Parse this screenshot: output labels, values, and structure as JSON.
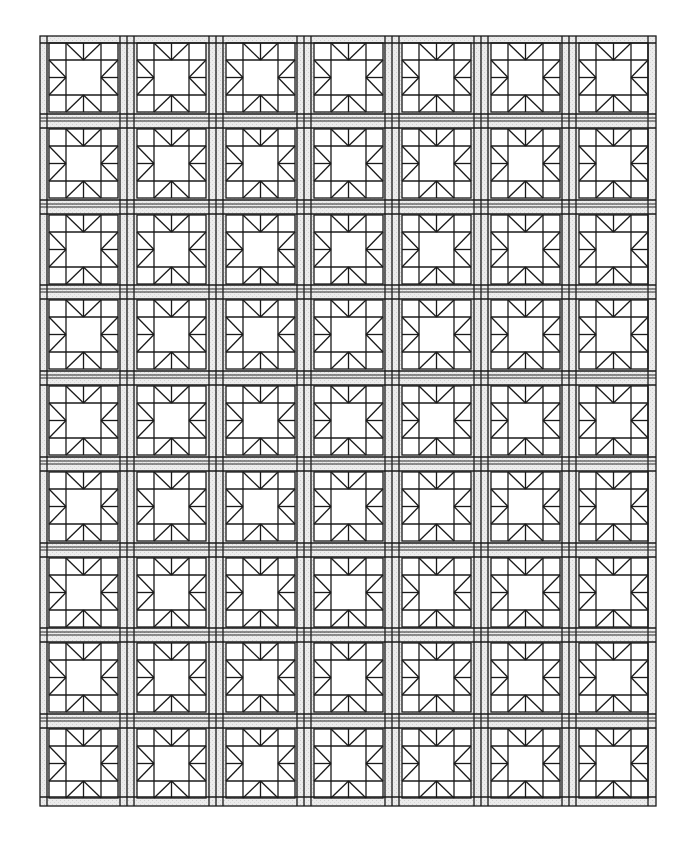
{
  "diagram": {
    "type": "quilt-layout",
    "block_name": "sawtooth star",
    "rows": 9,
    "columns": 7,
    "layout": {
      "origin_x": 40,
      "origin_y": 36,
      "right_edge": 656,
      "bottom_edge": 806,
      "block_left_first": 49,
      "block_top_first": 43,
      "col_pitch": 88.3,
      "row_pitch": 85.75,
      "block_size": 69,
      "corner_fraction": 0.25
    },
    "colors": {
      "line": "#1a1a1a",
      "background": "#ffffff",
      "sashing": "#e6e6e6",
      "sashing_dots": "#c8c8c8"
    }
  }
}
